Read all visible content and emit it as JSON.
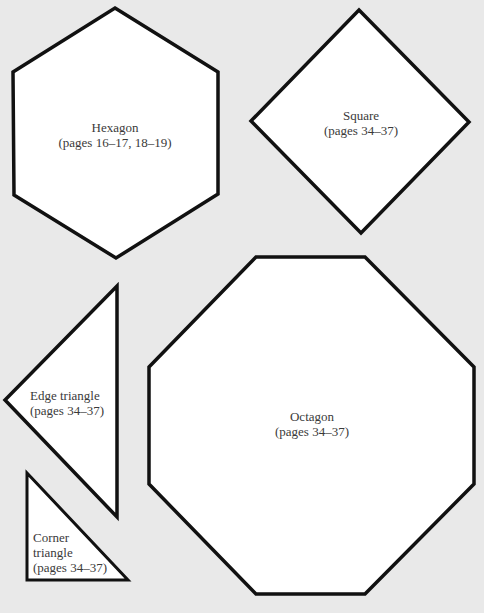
{
  "colors": {
    "background": "#e9e9e9",
    "shape_fill": "#ffffff",
    "outline": "#111111",
    "text": "#3a3a3a"
  },
  "shapes": [
    {
      "id": "hexagon",
      "name": "Hexagon",
      "pages": "(pages 16–17, 18–19)",
      "points": "115,8 218,72 218,194 116,258 14,195 13,72"
    },
    {
      "id": "square",
      "name": "Square",
      "pages": "(pages 34–37)",
      "points": "359,10 469,122 361,233 251,121"
    },
    {
      "id": "edge-triangle",
      "name": "Edge triangle",
      "pages": "(pages 34–37)",
      "points": "117,286 117,517 5,400"
    },
    {
      "id": "corner-triangle",
      "name_line1": "Corner",
      "name_line2": "triangle",
      "pages": "(pages 34–37)",
      "points": "27,473 128,580 27,580"
    },
    {
      "id": "octagon",
      "name": "Octagon",
      "pages": "(pages 34–37)",
      "points": "256,257 365,257 474,367 474,484 365,594 256,594 149,484 149,367"
    }
  ]
}
